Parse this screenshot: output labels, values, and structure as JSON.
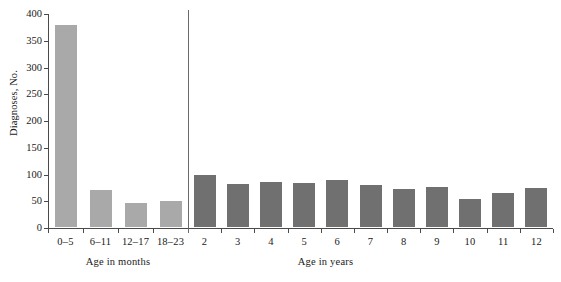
{
  "chart_data": {
    "type": "bar",
    "title": "",
    "subtitle": "",
    "xlabel": "",
    "ylabel": "Diagnoses, No.",
    "ylim": [
      0,
      400
    ],
    "yticks": [
      0,
      50,
      100,
      150,
      200,
      250,
      300,
      350,
      400
    ],
    "grid": false,
    "legend": null,
    "panels": [
      {
        "name": "months",
        "caption": "Age in months",
        "color": "#a9a9a9",
        "categories": [
          "0–5",
          "6–11",
          "12–17",
          "18–23"
        ],
        "values": [
          378,
          69,
          45,
          48
        ]
      },
      {
        "name": "years",
        "caption": "Age in years",
        "color": "#707070",
        "categories": [
          "2",
          "3",
          "4",
          "5",
          "6",
          "7",
          "8",
          "9",
          "10",
          "11",
          "12"
        ],
        "values": [
          97,
          81,
          85,
          82,
          88,
          79,
          71,
          74,
          52,
          64,
          73
        ]
      }
    ],
    "annotations": [
      {
        "name": "panel-divider",
        "description": "vertical rule separating months panel from years panel"
      }
    ]
  },
  "axes": {
    "y_title": "Diagnoses, No.",
    "y_tick_labels": [
      "400",
      "350",
      "300",
      "250",
      "200",
      "150",
      "100",
      "50",
      "0"
    ]
  },
  "colors": {
    "months_bar": "#a9a9a9",
    "years_bar": "#707070",
    "axis": "#4a4a4a",
    "divider": "#6a6a6a",
    "background": "#ffffff",
    "text": "#1a1a1a"
  }
}
